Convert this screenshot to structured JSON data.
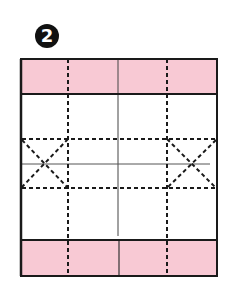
{
  "step": {
    "number": "2"
  },
  "colors": {
    "band_fill": "#f8c9d4",
    "outline": "#1a1a1a",
    "background": "#ffffff"
  },
  "diagram": {
    "box": {
      "x": 21,
      "y": 59,
      "width": 196,
      "height": 217
    },
    "top_band": {
      "y": 59,
      "height": 35
    },
    "bottom_band": {
      "y": 240,
      "height": 36
    },
    "dashed_verticals_x": [
      68,
      167
    ],
    "dashed_horizontals_y": [
      139,
      188
    ],
    "center_vertical_x": 118,
    "center_horizontal_y": 164,
    "x_marks": [
      {
        "x1": 21,
        "x2": 68,
        "y1": 139,
        "y2": 188
      },
      {
        "x1": 167,
        "x2": 217,
        "y1": 139,
        "y2": 188
      }
    ]
  }
}
